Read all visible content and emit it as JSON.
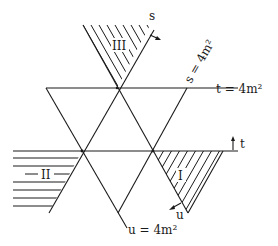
{
  "diagram": {
    "type": "Mandelstam plane",
    "colors": {
      "ink": "#1a1a1a",
      "background": "#ffffff"
    },
    "line_labels": {
      "s_line": "s = 4m²",
      "t_line": "t = 4m²",
      "u_line": "u = 4m²"
    },
    "axis_labels": {
      "s_axis": "s",
      "t_axis": "t",
      "u_axis": "u"
    },
    "regions": [
      {
        "id": "I",
        "label": "I"
      },
      {
        "id": "II",
        "label": "II"
      },
      {
        "id": "III",
        "label": "III"
      }
    ]
  }
}
